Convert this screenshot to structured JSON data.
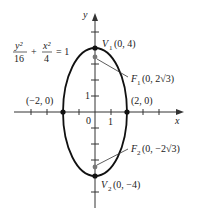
{
  "figure": {
    "equation": {
      "num1": "y²",
      "den1": "16",
      "plus": "+",
      "num2": "x²",
      "den2": "4",
      "eq": "= 1"
    },
    "axes": {
      "x_label": "x",
      "y_label": "y",
      "origin_label": "0",
      "x_tick_label": "1",
      "y_tick_label": "1"
    },
    "points": {
      "v1": {
        "name": "V",
        "sub": "1",
        "coords": "(0, 4)"
      },
      "v2": {
        "name": "V",
        "sub": "2",
        "coords": "(0, −4)"
      },
      "f1": {
        "name": "F",
        "sub": "1",
        "coords": "(0, 2√3)"
      },
      "f2": {
        "name": "F",
        "sub": "2",
        "coords": "(0, −2√3)"
      },
      "left": {
        "coords": "(−2, 0)"
      },
      "right": {
        "coords": "(2, 0)"
      }
    },
    "colors": {
      "curve": "#111111",
      "focus": "#777777",
      "axis": "#333333"
    }
  }
}
